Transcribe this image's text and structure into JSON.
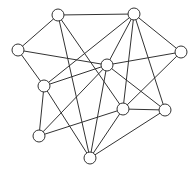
{
  "diagram": {
    "type": "undirected-graph",
    "node_radius": 6,
    "stroke_color": "#333333",
    "node_fill": "#ffffff",
    "nodes": [
      {
        "id": "A",
        "x": 58,
        "y": 15
      },
      {
        "id": "B",
        "x": 134,
        "y": 14
      },
      {
        "id": "C",
        "x": 18,
        "y": 50
      },
      {
        "id": "D",
        "x": 181,
        "y": 52
      },
      {
        "id": "E",
        "x": 107,
        "y": 65
      },
      {
        "id": "F",
        "x": 44,
        "y": 86
      },
      {
        "id": "G",
        "x": 123,
        "y": 109
      },
      {
        "id": "H",
        "x": 165,
        "y": 110
      },
      {
        "id": "I",
        "x": 39,
        "y": 136
      },
      {
        "id": "J",
        "x": 90,
        "y": 158
      }
    ],
    "edges": [
      [
        "A",
        "B"
      ],
      [
        "A",
        "C"
      ],
      [
        "A",
        "J"
      ],
      [
        "A",
        "G"
      ],
      [
        "C",
        "E"
      ],
      [
        "C",
        "F"
      ],
      [
        "B",
        "E"
      ],
      [
        "B",
        "F"
      ],
      [
        "B",
        "G"
      ],
      [
        "B",
        "H"
      ],
      [
        "B",
        "D"
      ],
      [
        "D",
        "E"
      ],
      [
        "D",
        "G"
      ],
      [
        "E",
        "F"
      ],
      [
        "E",
        "I"
      ],
      [
        "E",
        "J"
      ],
      [
        "E",
        "H"
      ],
      [
        "F",
        "I"
      ],
      [
        "F",
        "J"
      ],
      [
        "G",
        "H"
      ],
      [
        "G",
        "I"
      ],
      [
        "G",
        "J"
      ],
      [
        "H",
        "J"
      ]
    ]
  }
}
